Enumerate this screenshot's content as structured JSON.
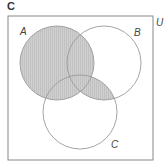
{
  "heading": "C",
  "universe": {
    "label": "U",
    "x": 8,
    "y": 16,
    "width": 145,
    "height": 144,
    "stroke": "#888888"
  },
  "sets": [
    {
      "label": "A",
      "cx": 57,
      "cy": 63,
      "r": 37,
      "label_x": 20,
      "label_y": 35
    },
    {
      "label": "B",
      "cx": 104,
      "cy": 63,
      "r": 37,
      "label_x": 134,
      "label_y": 36
    },
    {
      "label": "C",
      "cx": 80,
      "cy": 112,
      "r": 37,
      "label_x": 111,
      "label_y": 148
    }
  ],
  "shaded_region": "A ∪ (B ∩ C)",
  "colors": {
    "shade": "#cfcfcf",
    "hatch": "#bdbdbd",
    "circle_stroke": "#9a9a9a",
    "box_stroke": "#888888"
  }
}
